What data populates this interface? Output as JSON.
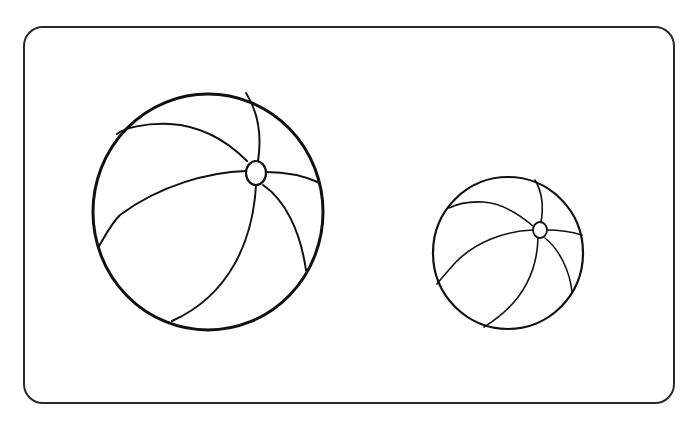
{
  "colors": {
    "stroke": "#111111",
    "frame": "#2a2a2a",
    "background": "#ffffff"
  },
  "objects": [
    {
      "name": "large-beach-ball",
      "label": "Large beach ball",
      "cx": 208,
      "cy": 212,
      "rx": 115,
      "ry": 118
    },
    {
      "name": "small-beach-ball",
      "label": "Small beach ball",
      "cx": 508,
      "cy": 253,
      "rx": 75,
      "ry": 76
    }
  ]
}
